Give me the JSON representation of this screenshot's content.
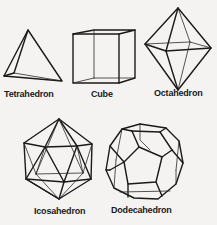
{
  "figure": {
    "solids": [
      {
        "name": "Tetrahedron"
      },
      {
        "name": "Cube"
      },
      {
        "name": "Octahedron"
      },
      {
        "name": "Icosahedron"
      },
      {
        "name": "Dodecahedron"
      }
    ]
  },
  "colors": {
    "background": "#f4f3f1",
    "line": "#1a1a1a"
  }
}
